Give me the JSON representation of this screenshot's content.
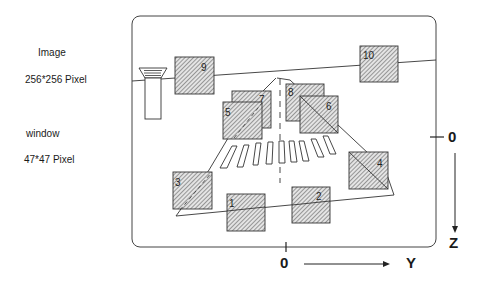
{
  "legend": {
    "image_title": "Image",
    "image_size": "256*256 Pixel",
    "window_title": "window",
    "window_size": "47*47 Pixel"
  },
  "axes": {
    "z_origin": "0",
    "z_label": "Z",
    "y_origin": "0",
    "y_label": "Y"
  },
  "windows": [
    {
      "id": "1",
      "x": 227,
      "y": 194
    },
    {
      "id": "2",
      "x": 292,
      "y": 187
    },
    {
      "id": "3",
      "x": 173,
      "y": 172
    },
    {
      "id": "4",
      "x": 349,
      "y": 152
    },
    {
      "id": "5",
      "x": 223,
      "y": 102
    },
    {
      "id": "6",
      "x": 300,
      "y": 96
    },
    {
      "id": "7",
      "x": 232,
      "y": 91
    },
    {
      "id": "8",
      "x": 286,
      "y": 84
    },
    {
      "id": "9",
      "x": 175,
      "y": 57
    },
    {
      "id": "10",
      "x": 360,
      "y": 46
    }
  ],
  "colors": {
    "line": "#333333",
    "hatch": "#444444",
    "fill": "#d8d8d8"
  }
}
